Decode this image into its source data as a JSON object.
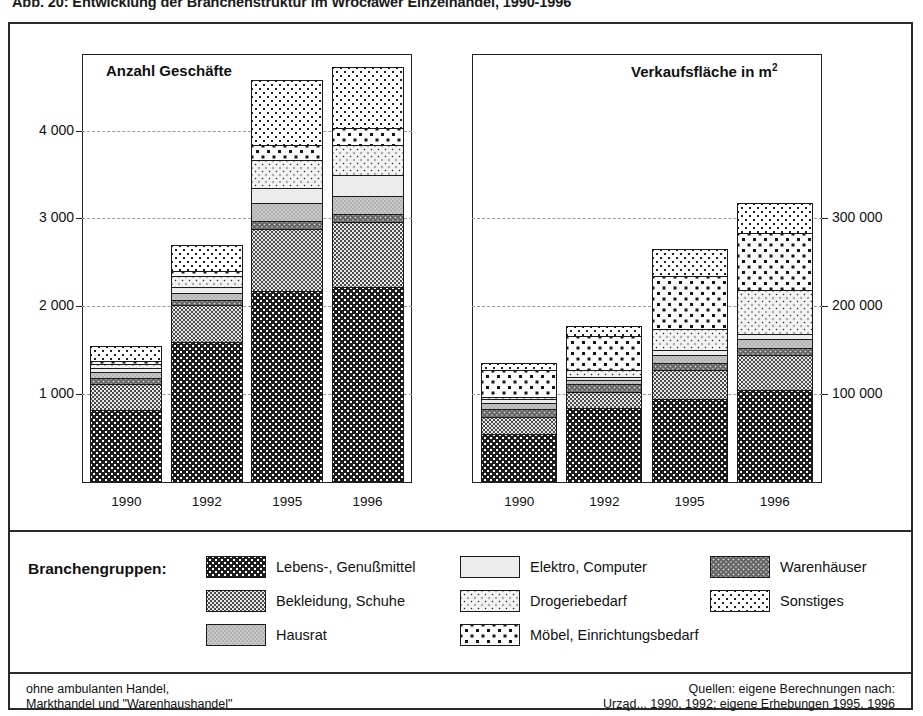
{
  "figure": {
    "caption": "Abb. 20: Entwicklung der Branchenstruktur im Wrocławer Einzelhandel, 1990-1996"
  },
  "panels": {
    "left_title": "Anzahl Geschäfte",
    "right_title_main": "Verkaufsfläche in m",
    "right_title_sup": "2"
  },
  "axes": {
    "left_ticks": [
      "4 000",
      "3 000",
      "2 000",
      "1 000"
    ],
    "right_ticks": [
      "300 000",
      "200 000",
      "100 000"
    ],
    "categories": [
      "1990",
      "1992",
      "1995",
      "1996"
    ]
  },
  "legend": {
    "title": "Branchengruppen:",
    "items": [
      {
        "label": "Lebens-, Genußmittel",
        "key": "lebens",
        "col": 0,
        "row": 0
      },
      {
        "label": "Bekleidung, Schuhe",
        "key": "bekleidung",
        "col": 0,
        "row": 1
      },
      {
        "label": "Hausrat",
        "key": "hausrat",
        "col": 0,
        "row": 2
      },
      {
        "label": "Elektro, Computer",
        "key": "elektro",
        "col": 1,
        "row": 0
      },
      {
        "label": "Drogeriebedarf",
        "key": "drogerie",
        "col": 1,
        "row": 1
      },
      {
        "label": "Möbel, Einrichtungsbedarf",
        "key": "moebel",
        "col": 1,
        "row": 2
      },
      {
        "label": "Warenhäuser",
        "key": "warenhaeuser",
        "col": 2,
        "row": 0
      },
      {
        "label": "Sonstiges",
        "key": "sonstiges",
        "col": 2,
        "row": 1
      }
    ]
  },
  "footnotes": {
    "left_line1": "ohne ambulanten Handel,",
    "left_line2": "Markthandel und \"Warenhaushandel\"",
    "right_line1": "Quellen: eigene Berechnungen nach:",
    "right_line2": "Urząd... 1990, 1992; eigene Erhebungen 1995, 1996"
  },
  "chart_data": [
    {
      "type": "bar",
      "id": "anzahl-geschaefte",
      "stacked": true,
      "title": "Anzahl Geschäfte",
      "xlabel": "",
      "ylabel": "Anzahl Geschäfte",
      "ylim": [
        0,
        4860
      ],
      "ytick_values": [
        1000,
        2000,
        3000,
        4000
      ],
      "grid": true,
      "legend_position": "bottom",
      "categories": [
        "1990",
        "1992",
        "1995",
        "1996"
      ],
      "stack_order": [
        "lebens",
        "bekleidung",
        "warenhaeuser",
        "hausrat",
        "elektro",
        "drogerie",
        "moebel",
        "sonstiges"
      ],
      "series": [
        {
          "name": "Lebens-, Genußmittel",
          "key": "lebens",
          "values": [
            820,
            1590,
            2175,
            2215
          ]
        },
        {
          "name": "Bekleidung, Schuhe",
          "key": "bekleidung",
          "values": [
            290,
            420,
            710,
            745
          ]
        },
        {
          "name": "Warenhäuser",
          "key": "warenhaeuser",
          "values": [
            75,
            65,
            90,
            85
          ]
        },
        {
          "name": "Hausrat",
          "key": "hausrat",
          "values": [
            70,
            80,
            205,
            205
          ]
        },
        {
          "name": "Elektro, Computer",
          "key": "elektro",
          "values": [
            45,
            60,
            170,
            245
          ]
        },
        {
          "name": "Drogeriebedarf",
          "key": "drogerie",
          "values": [
            45,
            135,
            310,
            345
          ]
        },
        {
          "name": "Möbel, Einrichtungsbedarf",
          "key": "moebel",
          "values": [
            35,
            55,
            175,
            185
          ]
        },
        {
          "name": "Sonstiges",
          "key": "sonstiges",
          "values": [
            170,
            290,
            735,
            695
          ]
        }
      ],
      "totals": [
        1550,
        2695,
        4570,
        4720
      ]
    },
    {
      "type": "bar",
      "id": "verkaufsflaeche",
      "stacked": true,
      "title": "Verkaufsfläche in m2",
      "xlabel": "",
      "ylabel": "Verkaufsfläche in m2",
      "ylim": [
        0,
        486000
      ],
      "ytick_values": [
        100000,
        200000,
        300000
      ],
      "grid": true,
      "legend_position": "bottom",
      "categories": [
        "1990",
        "1992",
        "1995",
        "1996"
      ],
      "stack_order": [
        "lebens",
        "bekleidung",
        "warenhaeuser",
        "hausrat",
        "elektro",
        "drogerie",
        "moebel",
        "sonstiges"
      ],
      "series": [
        {
          "name": "Lebens-, Genußmittel",
          "key": "lebens",
          "values": [
            55000,
            84000,
            95000,
            105000
          ]
        },
        {
          "name": "Bekleidung, Schuhe",
          "key": "bekleidung",
          "values": [
            19000,
            19000,
            32000,
            39000
          ]
        },
        {
          "name": "Warenhäuser",
          "key": "warenhaeuser",
          "values": [
            9000,
            8000,
            9000,
            9000
          ]
        },
        {
          "name": "Hausrat",
          "key": "hausrat",
          "values": [
            7000,
            5000,
            9000,
            10000
          ]
        },
        {
          "name": "Elektro, Computer",
          "key": "elektro",
          "values": [
            4000,
            4000,
            5000,
            6000
          ]
        },
        {
          "name": "Drogeriebedarf",
          "key": "drogerie",
          "values": [
            3000,
            7000,
            24000,
            50000
          ]
        },
        {
          "name": "Möbel, Einrichtungsbedarf",
          "key": "moebel",
          "values": [
            31000,
            39000,
            60000,
            64000
          ]
        },
        {
          "name": "Sonstiges",
          "key": "sonstiges",
          "values": [
            7000,
            11000,
            31000,
            35000
          ]
        }
      ],
      "totals": [
        135000,
        177000,
        265000,
        318000
      ]
    }
  ]
}
